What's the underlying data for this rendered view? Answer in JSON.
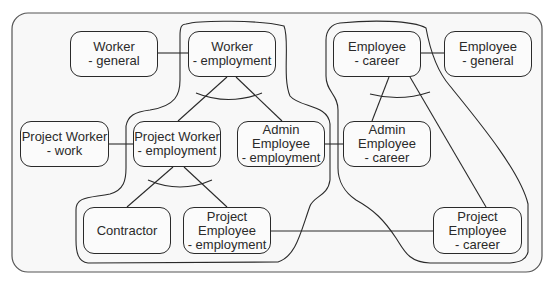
{
  "diagram": {
    "colors": {
      "stroke": "#2a2a2a",
      "background": "#fbfbfb",
      "frame": "#555555"
    },
    "nodes": [
      {
        "id": "worker-general",
        "label": "Worker\n- general",
        "x": 70,
        "y": 31,
        "w": 88,
        "h": 46
      },
      {
        "id": "worker-employment",
        "label": "Worker\n- employment",
        "x": 188,
        "y": 31,
        "w": 88,
        "h": 46
      },
      {
        "id": "employee-career",
        "label": "Employee\n- career",
        "x": 333,
        "y": 31,
        "w": 88,
        "h": 46
      },
      {
        "id": "employee-general",
        "label": "Employee\n- general",
        "x": 444,
        "y": 31,
        "w": 88,
        "h": 46
      },
      {
        "id": "project-worker-work",
        "label": "Project Worker\n- work",
        "x": 20,
        "y": 121,
        "w": 89,
        "h": 46
      },
      {
        "id": "project-worker-employment",
        "label": "Project Worker\n- employment",
        "x": 133,
        "y": 121,
        "w": 88,
        "h": 46
      },
      {
        "id": "admin-employee-employment",
        "label": "Admin\nEmployee\n- employment",
        "x": 237,
        "y": 121,
        "w": 88,
        "h": 46
      },
      {
        "id": "admin-employee-career",
        "label": "Admin\nEmployee\n- career",
        "x": 343,
        "y": 121,
        "w": 88,
        "h": 46
      },
      {
        "id": "contractor",
        "label": "Contractor",
        "x": 83,
        "y": 207,
        "w": 88,
        "h": 47
      },
      {
        "id": "project-employee-employment",
        "label": "Project\nEmployee\n- employment",
        "x": 183,
        "y": 207,
        "w": 88,
        "h": 47
      },
      {
        "id": "project-employee-career",
        "label": "Project\nEmployee\n- career",
        "x": 433,
        "y": 207,
        "w": 89,
        "h": 47
      }
    ],
    "edges": [
      {
        "from": "worker-general",
        "to": "worker-employment",
        "type": "association"
      },
      {
        "from": "employee-career",
        "to": "employee-general",
        "type": "association"
      },
      {
        "from": "project-worker-work",
        "to": "project-worker-employment",
        "type": "association"
      },
      {
        "from": "admin-employee-employment",
        "to": "admin-employee-career",
        "type": "association"
      },
      {
        "from": "project-employee-employment",
        "to": "project-employee-career",
        "type": "association"
      },
      {
        "from": "worker-employment",
        "to": "project-worker-employment",
        "type": "specialization"
      },
      {
        "from": "worker-employment",
        "to": "admin-employee-employment",
        "type": "specialization"
      },
      {
        "from": "project-worker-employment",
        "to": "contractor",
        "type": "specialization"
      },
      {
        "from": "project-worker-employment",
        "to": "project-employee-employment",
        "type": "specialization"
      },
      {
        "from": "employee-career",
        "to": "admin-employee-career",
        "type": "specialization"
      },
      {
        "from": "employee-career",
        "to": "project-employee-career",
        "type": "specialization"
      }
    ],
    "groups": [
      {
        "id": "employment-group",
        "members": [
          "worker-employment",
          "project-worker-employment",
          "admin-employee-employment",
          "contractor",
          "project-employee-employment"
        ]
      },
      {
        "id": "career-group",
        "members": [
          "employee-career",
          "admin-employee-career",
          "project-employee-career"
        ]
      }
    ]
  }
}
